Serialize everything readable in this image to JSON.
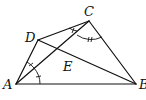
{
  "figure": {
    "type": "geometry-quadrilateral",
    "points": {
      "A": {
        "label": "A",
        "x": 16,
        "y": 84
      },
      "B": {
        "label": "B",
        "x": 136,
        "y": 84
      },
      "C": {
        "label": "C",
        "x": 89,
        "y": 21
      },
      "D": {
        "label": "D",
        "x": 38,
        "y": 40
      },
      "E": {
        "label": "E",
        "x": 69,
        "y": 54
      }
    },
    "segments": [
      "AB",
      "BC",
      "CD",
      "DA",
      "AC",
      "DB"
    ],
    "angle_marks": [
      {
        "vertex": "A",
        "between": [
          "AD",
          "AC"
        ],
        "ticks": 1
      },
      {
        "vertex": "A",
        "between": [
          "AC",
          "AB"
        ],
        "ticks": 1
      },
      {
        "vertex": "C",
        "between": [
          "CD",
          "CA"
        ],
        "ticks": 1
      },
      {
        "vertex": "C",
        "between": [
          "CA",
          "CB"
        ],
        "ticks": 2
      }
    ],
    "labels": {
      "A": "A",
      "B": "B",
      "C": "C",
      "D": "D",
      "E": "E"
    }
  }
}
